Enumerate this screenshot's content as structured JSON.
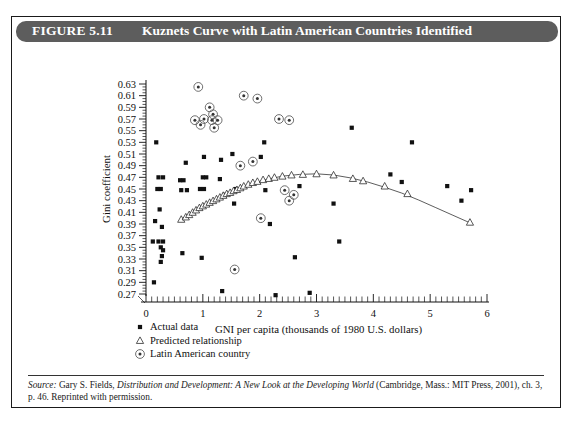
{
  "figure": {
    "number_label": "FIGURE 5.11",
    "title": "Kuznets Curve with Latin American Countries Identified"
  },
  "source": {
    "label": "Source:",
    "text_part1": " Gary S. Fields, ",
    "work_title": "Distribution and Development: A New Look at the Developing World",
    "text_part2": " (Cambridge, Mass.: MIT Press, 2001), ch. 3, p. 46. Reprinted with permission."
  },
  "legend": {
    "items": [
      {
        "label": "Actual data",
        "marker": "filled-square",
        "color": "#111111"
      },
      {
        "label": "Predicted relationship",
        "marker": "open-triangle",
        "color": "#222222"
      },
      {
        "label": "Latin American country",
        "marker": "circled-dot",
        "color": "#555555"
      }
    ]
  },
  "chart_data": {
    "type": "scatter",
    "title": "Kuznets Curve with Latin American Countries Identified",
    "xlabel": "GNI per capita (thousands of 1980 U.S. dollars)",
    "ylabel": "Gini coefficient",
    "xlim": [
      0,
      6
    ],
    "ylim": [
      0.27,
      0.63
    ],
    "xticks": [
      0,
      1,
      2,
      3,
      4,
      5,
      6
    ],
    "xtick_labels": [
      "0",
      "1",
      "2",
      "3",
      "4",
      "5",
      "6"
    ],
    "x_minor_step": 0.1,
    "yticks": [
      0.27,
      0.29,
      0.31,
      0.33,
      0.35,
      0.37,
      0.39,
      0.41,
      0.43,
      0.45,
      0.47,
      0.49,
      0.51,
      0.53,
      0.55,
      0.57,
      0.59,
      0.61,
      0.63
    ],
    "ytick_labels": [
      "0.27",
      "0.29",
      "0.31",
      "0.33",
      "0.35",
      "0.37",
      "0.39",
      "0.41",
      "0.43",
      "0.45",
      "0.47",
      "0.49",
      "0.51",
      "0.53",
      "0.55",
      "0.57",
      "0.59",
      "0.61",
      "0.63"
    ],
    "y_minor_step": 0.005,
    "grid": false,
    "legend_position": "below-axes-left",
    "series": [
      {
        "name": "Actual data",
        "marker": "filled-square",
        "points": [
          [
            0.18,
            0.53
          ],
          [
            0.22,
            0.47
          ],
          [
            0.3,
            0.47
          ],
          [
            0.26,
            0.45
          ],
          [
            0.2,
            0.45
          ],
          [
            0.24,
            0.415
          ],
          [
            0.16,
            0.395
          ],
          [
            0.12,
            0.36
          ],
          [
            0.22,
            0.36
          ],
          [
            0.3,
            0.36
          ],
          [
            0.28,
            0.385
          ],
          [
            0.26,
            0.35
          ],
          [
            0.3,
            0.345
          ],
          [
            0.28,
            0.335
          ],
          [
            0.26,
            0.325
          ],
          [
            0.14,
            0.29
          ],
          [
            0.7,
            0.495
          ],
          [
            0.6,
            0.465
          ],
          [
            0.66,
            0.465
          ],
          [
            0.62,
            0.448
          ],
          [
            0.72,
            0.448
          ],
          [
            0.64,
            0.34
          ],
          [
            0.95,
            0.45
          ],
          [
            1.02,
            0.45
          ],
          [
            1.0,
            0.47
          ],
          [
            1.06,
            0.47
          ],
          [
            1.02,
            0.505
          ],
          [
            0.98,
            0.332
          ],
          [
            1.32,
            0.5
          ],
          [
            1.3,
            0.467
          ],
          [
            1.38,
            0.44
          ],
          [
            1.34,
            0.275
          ],
          [
            1.52,
            0.51
          ],
          [
            1.58,
            0.45
          ],
          [
            1.55,
            0.425
          ],
          [
            2.08,
            0.53
          ],
          [
            2.02,
            0.505
          ],
          [
            2.1,
            0.448
          ],
          [
            2.18,
            0.39
          ],
          [
            2.28,
            0.268
          ],
          [
            2.7,
            0.455
          ],
          [
            2.62,
            0.333
          ],
          [
            2.88,
            0.272
          ],
          [
            3.3,
            0.425
          ],
          [
            3.4,
            0.36
          ],
          [
            3.62,
            0.555
          ],
          [
            4.3,
            0.475
          ],
          [
            4.5,
            0.462
          ],
          [
            4.68,
            0.53
          ],
          [
            5.3,
            0.455
          ],
          [
            5.55,
            0.43
          ],
          [
            5.72,
            0.448
          ]
        ]
      },
      {
        "name": "Predicted relationship",
        "marker": "open-triangle",
        "points": [
          [
            0.62,
            0.398
          ],
          [
            0.7,
            0.402
          ],
          [
            0.76,
            0.406
          ],
          [
            0.82,
            0.41
          ],
          [
            0.88,
            0.414
          ],
          [
            0.94,
            0.418
          ],
          [
            1.0,
            0.421
          ],
          [
            1.06,
            0.424
          ],
          [
            1.12,
            0.427
          ],
          [
            1.18,
            0.43
          ],
          [
            1.24,
            0.433
          ],
          [
            1.3,
            0.436
          ],
          [
            1.36,
            0.439
          ],
          [
            1.42,
            0.442
          ],
          [
            1.48,
            0.444
          ],
          [
            1.54,
            0.447
          ],
          [
            1.6,
            0.449
          ],
          [
            1.66,
            0.452
          ],
          [
            1.72,
            0.455
          ],
          [
            1.8,
            0.458
          ],
          [
            1.88,
            0.461
          ],
          [
            1.96,
            0.463
          ],
          [
            2.06,
            0.466
          ],
          [
            2.16,
            0.468
          ],
          [
            2.26,
            0.47
          ],
          [
            2.4,
            0.472
          ],
          [
            2.56,
            0.474
          ],
          [
            2.76,
            0.475
          ],
          [
            3.0,
            0.476
          ],
          [
            3.3,
            0.474
          ],
          [
            3.64,
            0.468
          ],
          [
            3.82,
            0.464
          ],
          [
            4.2,
            0.455
          ],
          [
            4.6,
            0.442
          ],
          [
            5.7,
            0.393
          ]
        ]
      },
      {
        "name": "Latin American country",
        "marker": "circled-dot",
        "points": [
          [
            0.92,
            0.625
          ],
          [
            1.02,
            0.57
          ],
          [
            1.2,
            0.555
          ],
          [
            1.12,
            0.59
          ],
          [
            1.18,
            0.578
          ],
          [
            1.16,
            0.568
          ],
          [
            1.26,
            0.568
          ],
          [
            0.86,
            0.568
          ],
          [
            0.96,
            0.56
          ],
          [
            1.72,
            0.61
          ],
          [
            1.96,
            0.605
          ],
          [
            2.34,
            0.57
          ],
          [
            2.52,
            0.568
          ],
          [
            1.66,
            0.49
          ],
          [
            1.88,
            0.497
          ],
          [
            2.44,
            0.448
          ],
          [
            2.6,
            0.44
          ],
          [
            2.52,
            0.43
          ],
          [
            2.02,
            0.4
          ],
          [
            1.56,
            0.312
          ]
        ]
      }
    ],
    "fitted_curve": {
      "name": "Kuznets curve fit",
      "points": [
        [
          0.6,
          0.397
        ],
        [
          0.9,
          0.416
        ],
        [
          1.2,
          0.43
        ],
        [
          1.5,
          0.444
        ],
        [
          1.8,
          0.457
        ],
        [
          2.1,
          0.466
        ],
        [
          2.4,
          0.472
        ],
        [
          2.7,
          0.475
        ],
        [
          3.0,
          0.476
        ],
        [
          3.3,
          0.474
        ],
        [
          3.6,
          0.469
        ],
        [
          3.9,
          0.462
        ],
        [
          4.2,
          0.453
        ],
        [
          4.5,
          0.443
        ],
        [
          4.8,
          0.431
        ],
        [
          5.1,
          0.418
        ],
        [
          5.4,
          0.405
        ],
        [
          5.7,
          0.392
        ]
      ]
    }
  }
}
